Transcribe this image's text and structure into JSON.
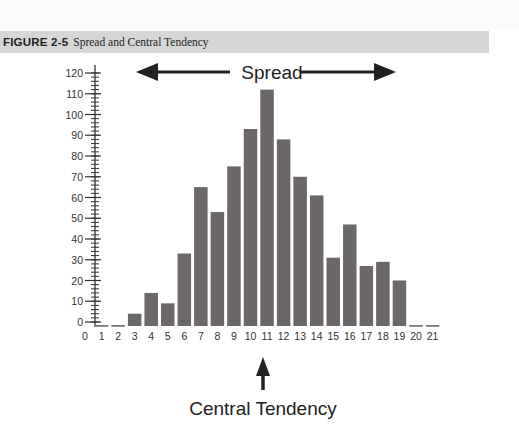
{
  "figure": {
    "label": "FIGURE 2-5",
    "title": "Spread and Central Tendency"
  },
  "annotations": {
    "spread": "Spread",
    "central_tendency": "Central Tendency"
  },
  "colors": {
    "bar": "#6b6867",
    "caption_bg": "#d6d6d6",
    "axis": "#333333"
  },
  "chart_data": {
    "type": "bar",
    "title": "Spread and Central Tendency",
    "xlabel": "",
    "ylabel": "",
    "categories": [
      "0",
      "1",
      "2",
      "3",
      "4",
      "5",
      "6",
      "7",
      "8",
      "9",
      "10",
      "11",
      "12",
      "13",
      "14",
      "15",
      "16",
      "17",
      "18",
      "19",
      "20",
      "21"
    ],
    "values": [
      0,
      0,
      0,
      4,
      14,
      9,
      33,
      65,
      53,
      75,
      93,
      112,
      88,
      70,
      61,
      31,
      47,
      27,
      29,
      20,
      0,
      0
    ],
    "ylim": [
      0,
      120
    ],
    "yticks": [
      0,
      10,
      20,
      30,
      40,
      50,
      60,
      70,
      80,
      90,
      100,
      110,
      120
    ],
    "minor_ytick_step": 2,
    "grid": false,
    "legend": null,
    "annotations": [
      {
        "text": "Spread",
        "type": "double-arrow",
        "position": "top"
      },
      {
        "text": "Central Tendency",
        "type": "up-arrow",
        "points_to": "11"
      }
    ]
  }
}
